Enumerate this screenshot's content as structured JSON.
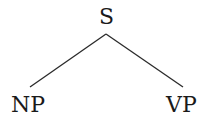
{
  "tree": {
    "root": {
      "label": "S"
    },
    "children": [
      {
        "label": "NP"
      },
      {
        "label": "VP"
      }
    ]
  },
  "colors": {
    "line": "#2a2a2a",
    "text": "#1a1a1a",
    "background": "#ffffff"
  }
}
